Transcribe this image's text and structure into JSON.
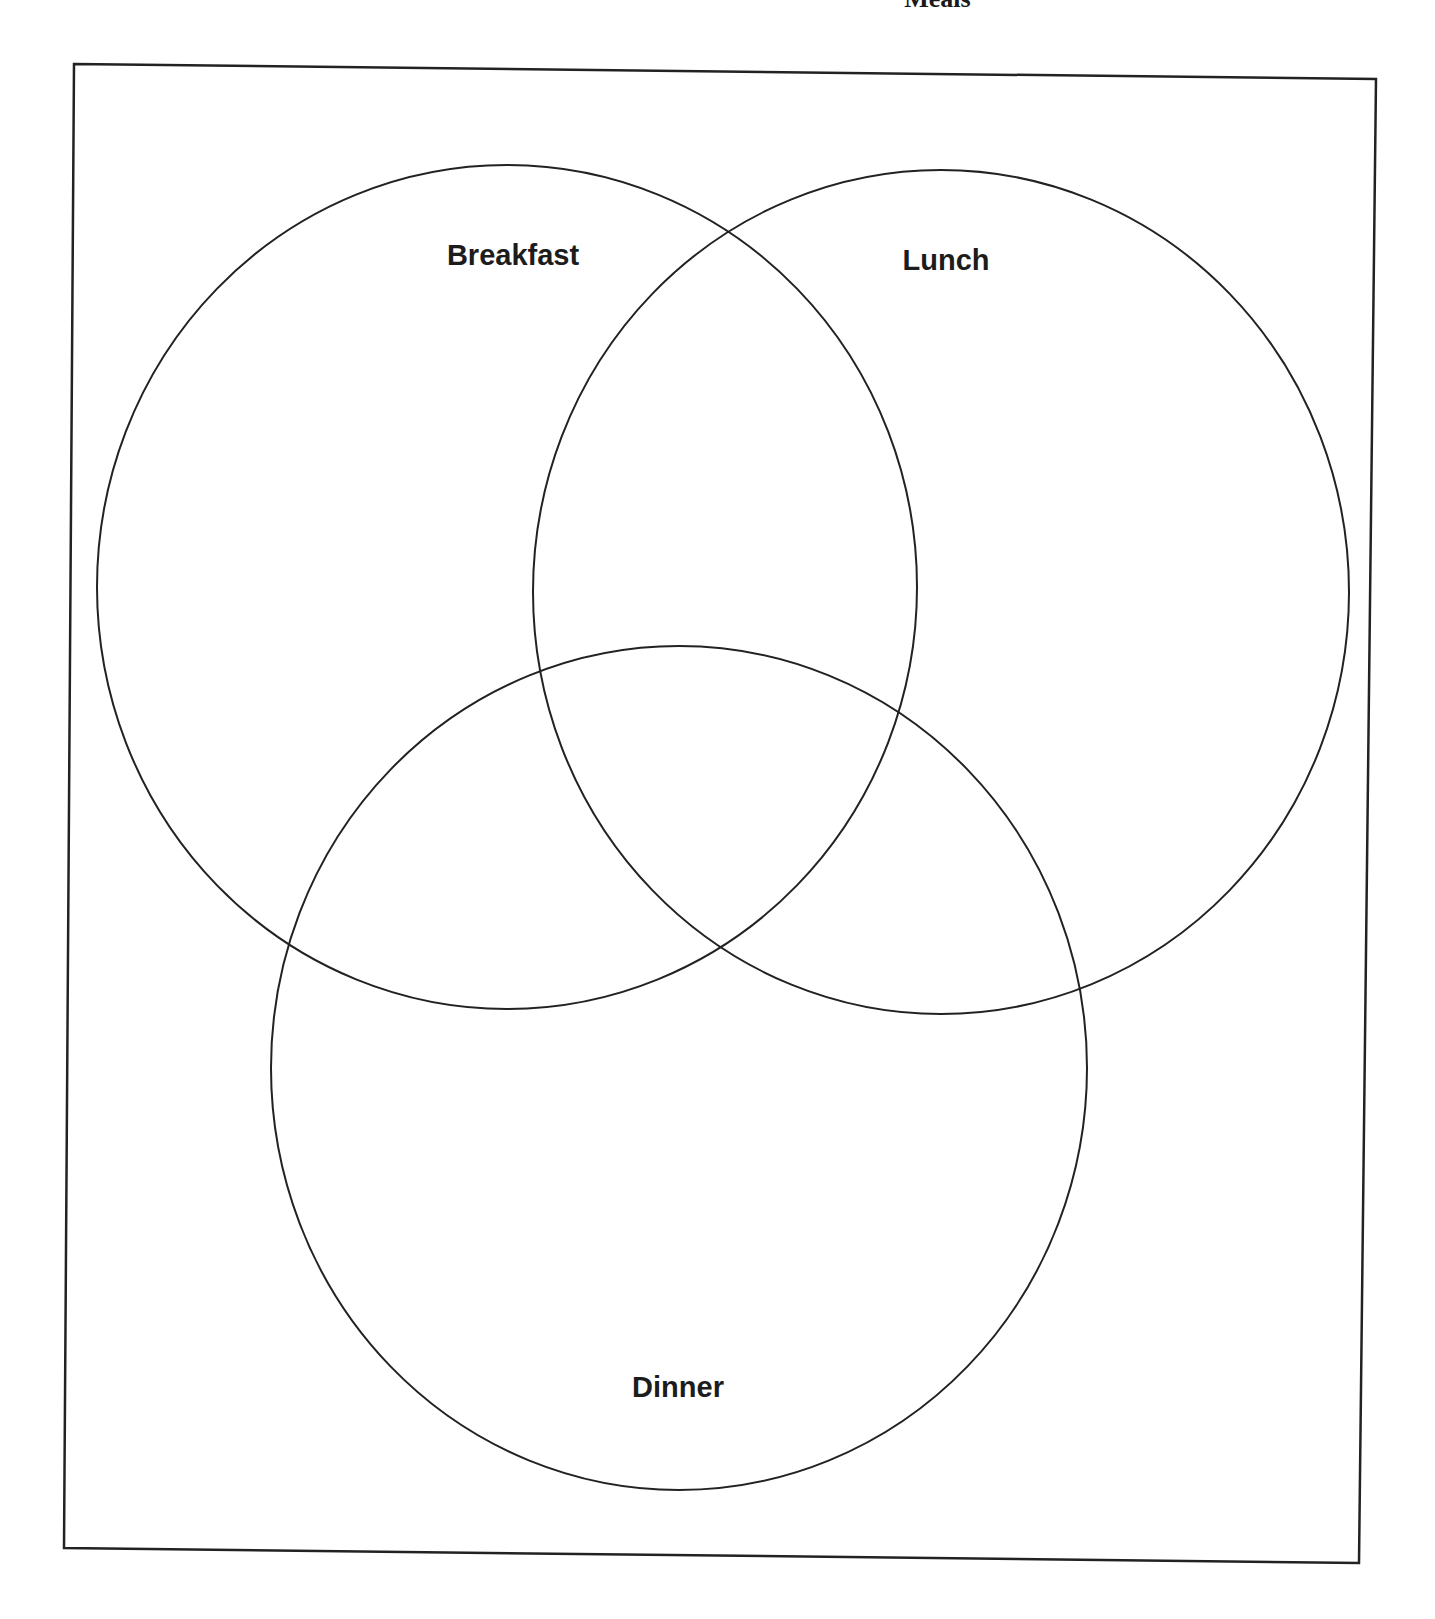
{
  "title": "Meals",
  "diagram": {
    "type": "venn",
    "sets": [
      {
        "label": "Breakfast",
        "cx": 507,
        "cy": 587,
        "rx": 410,
        "ry": 422,
        "label_x": 513,
        "label_y": 265
      },
      {
        "label": "Lunch",
        "cx": 941,
        "cy": 592,
        "rx": 408,
        "ry": 422,
        "label_x": 946,
        "label_y": 270
      },
      {
        "label": "Dinner",
        "cx": 679,
        "cy": 1068,
        "rx": 408,
        "ry": 422,
        "label_x": 678,
        "label_y": 1397
      }
    ],
    "frame": {
      "top_left": [
        74,
        64
      ],
      "top_right": [
        1376,
        79
      ],
      "bottom_right": [
        1359,
        1563
      ],
      "bottom_left": [
        64,
        1548
      ]
    },
    "stroke_color": "#222222"
  }
}
